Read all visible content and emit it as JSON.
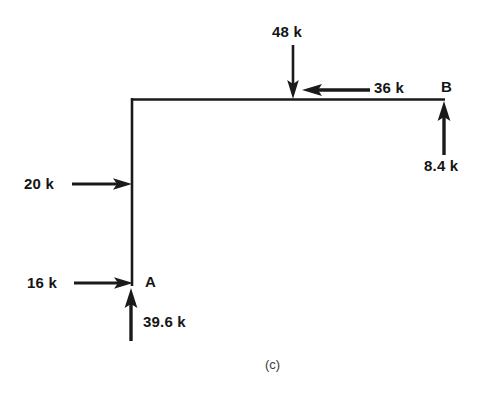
{
  "figure": {
    "caption": "(c)",
    "type": "free-body-diagram",
    "units": "k",
    "line_color": "#1a1a1a",
    "background_color": "#ffffff"
  },
  "structure": {
    "description": "L-shaped frame: vertical column joined to horizontal beam at top-left corner",
    "members": [
      {
        "name": "column",
        "orientation": "vertical"
      },
      {
        "name": "beam",
        "orientation": "horizontal"
      }
    ],
    "joints": [
      {
        "label": "A",
        "location": "bottom of column"
      },
      {
        "label": "B",
        "location": "right end of beam"
      }
    ]
  },
  "points": {
    "a_label": "A",
    "b_label": "B"
  },
  "forces": [
    {
      "id": "load-48k",
      "label": "48 k",
      "magnitude": 48,
      "direction": "down",
      "applied_at": "midspan of beam"
    },
    {
      "id": "load-36k",
      "label": "36 k",
      "magnitude": 36,
      "direction": "left",
      "applied_at": "beam, right of midspan"
    },
    {
      "id": "reaction-84k",
      "label": "8.4 k",
      "magnitude": 8.4,
      "direction": "up",
      "applied_at": "B"
    },
    {
      "id": "load-20k",
      "label": "20 k",
      "magnitude": 20,
      "direction": "right",
      "applied_at": "column, mid-height"
    },
    {
      "id": "load-16k",
      "label": "16 k",
      "magnitude": 16,
      "direction": "right",
      "applied_at": "A"
    },
    {
      "id": "reaction-396k",
      "label": "39.6 k",
      "magnitude": 39.6,
      "direction": "up",
      "applied_at": "A"
    }
  ],
  "labels": {
    "f48": "48 k",
    "f36": "36 k",
    "f84": "8.4 k",
    "f20": "20 k",
    "f16": "16 k",
    "f396": "39.6 k"
  }
}
